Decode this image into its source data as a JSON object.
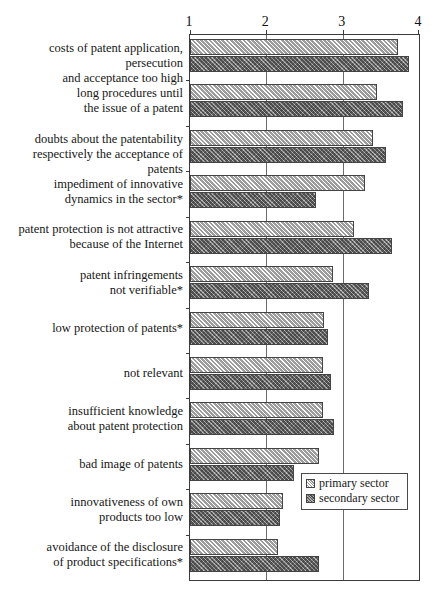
{
  "chart_data": {
    "type": "bar",
    "orientation": "horizontal",
    "title": "",
    "xlabel": "",
    "ylabel": "",
    "xlim": [
      1,
      4
    ],
    "xticks": [
      1,
      2,
      3,
      4
    ],
    "xtick_labels": [
      "1",
      "2",
      "3",
      "4"
    ],
    "grid": true,
    "legend_position": "bottom-right",
    "categories": [
      "costs of patent application, persecution and acceptance too high",
      "long procedures until the issue of a patent",
      "doubts about the patentability respectively the acceptance of patents",
      "impediment of innovative dynamics in the sector*",
      "patent protection is not attractive because of the Internet",
      "patent infringements not verifiable*",
      "low protection of patents*",
      "not relevant",
      "insufficient knowledge about patent protection",
      "bad image of patents",
      "innovativeness of own products too low",
      "avoidance of the disclosure of product specifications*"
    ],
    "category_lines": [
      [
        "costs of patent application, persecution",
        "and acceptance too high"
      ],
      [
        "long procedures until",
        "the issue of a patent"
      ],
      [
        "doubts about the patentability",
        "respectively the acceptance of patents"
      ],
      [
        "impediment of innovative",
        "dynamics in the sector*"
      ],
      [
        "patent protection is not attractive",
        "because of the Internet"
      ],
      [
        "patent infringements",
        "not verifiable*"
      ],
      [
        "low protection of patents*"
      ],
      [
        "not relevant"
      ],
      [
        "insufficient knowledge",
        "about patent protection"
      ],
      [
        "bad image of patents"
      ],
      [
        "innovativeness of own",
        "products too low"
      ],
      [
        "avoidance of the disclosure",
        "of product specifications*"
      ]
    ],
    "series": [
      {
        "name": "primary sector",
        "color": "#bdbdbd",
        "values": [
          3.73,
          3.45,
          3.4,
          3.29,
          3.15,
          2.87,
          2.76,
          2.74,
          2.74,
          2.69,
          2.22,
          2.15
        ]
      },
      {
        "name": "secondary sector",
        "color": "#7a7a7a",
        "values": [
          3.87,
          3.79,
          3.57,
          2.65,
          3.65,
          3.35,
          2.81,
          2.85,
          2.89,
          2.36,
          2.18,
          2.69
        ]
      }
    ]
  },
  "legend": {
    "items": [
      {
        "label": "primary sector"
      },
      {
        "label": "secondary sector"
      }
    ]
  }
}
